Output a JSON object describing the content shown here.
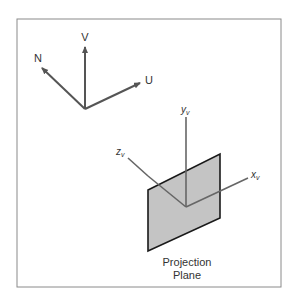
{
  "diagram": {
    "frame": {
      "stroke": "#8a8a8a"
    },
    "uvn_axes": {
      "v_label": "V",
      "u_label": "U",
      "n_label": "N",
      "color": "#555555"
    },
    "viewing_axes": {
      "y_label": "y",
      "y_sub": "v",
      "x_label": "x",
      "x_sub": "v",
      "z_label": "z",
      "z_sub": "v",
      "color": "#666666"
    },
    "projection_plane": {
      "fill": "#c4c4c4",
      "stroke": "#1a1a1a",
      "caption_line1": "Projection",
      "caption_line2": "Plane"
    }
  }
}
